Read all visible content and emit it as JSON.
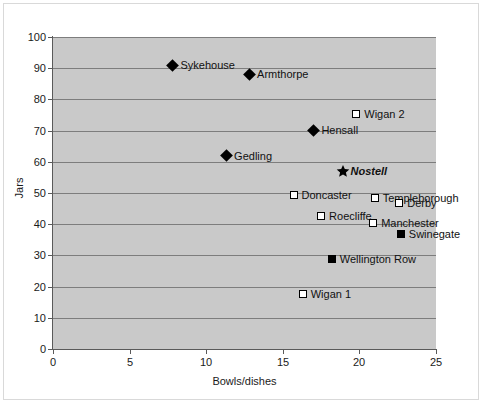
{
  "chart_data": {
    "type": "scatter",
    "title": "",
    "xlabel": "Bowls/dishes",
    "ylabel": "Jars",
    "xlim": [
      0,
      25
    ],
    "ylim": [
      0,
      100
    ],
    "xticks": [
      0,
      5,
      10,
      15,
      20,
      25
    ],
    "yticks": [
      0,
      10,
      20,
      30,
      40,
      50,
      60,
      70,
      80,
      90,
      100
    ],
    "grid": "horizontal",
    "legend": "none",
    "plot_background": "#c9c9c9",
    "gridline_color": "#7d7d7d",
    "marker_color": "#000000",
    "points": [
      {
        "label": "Sykehouse",
        "x": 7.8,
        "y": 91.0,
        "marker": "diamond",
        "emphasis": false
      },
      {
        "label": "Armthorpe",
        "x": 12.8,
        "y": 88.0,
        "marker": "diamond",
        "emphasis": false
      },
      {
        "label": "Wigan 2",
        "x": 19.8,
        "y": 75.3,
        "marker": "square-open",
        "emphasis": false
      },
      {
        "label": "Hensall",
        "x": 17.0,
        "y": 70.2,
        "marker": "diamond",
        "emphasis": false
      },
      {
        "label": "Gedling",
        "x": 11.3,
        "y": 62.0,
        "marker": "diamond",
        "emphasis": false
      },
      {
        "label": "Nostell",
        "x": 18.9,
        "y": 57.0,
        "marker": "star",
        "emphasis": true
      },
      {
        "label": "Doncaster",
        "x": 15.7,
        "y": 49.5,
        "marker": "square-open",
        "emphasis": false
      },
      {
        "label": "Templeborough",
        "x": 21.0,
        "y": 48.5,
        "marker": "square-open",
        "emphasis": false
      },
      {
        "label": "Derby",
        "x": 22.6,
        "y": 46.8,
        "marker": "square-open",
        "emphasis": false
      },
      {
        "label": "Roecliffe",
        "x": 17.5,
        "y": 42.5,
        "marker": "square-open",
        "emphasis": false
      },
      {
        "label": "Manchester",
        "x": 20.9,
        "y": 40.5,
        "marker": "square-open",
        "emphasis": false
      },
      {
        "label": "Swinegate",
        "x": 22.7,
        "y": 36.8,
        "marker": "square-filled",
        "emphasis": false
      },
      {
        "label": "Wellington Row",
        "x": 18.2,
        "y": 29.0,
        "marker": "square-filled",
        "emphasis": false
      },
      {
        "label": "Wigan 1",
        "x": 16.3,
        "y": 17.8,
        "marker": "square-open",
        "emphasis": false
      }
    ]
  }
}
